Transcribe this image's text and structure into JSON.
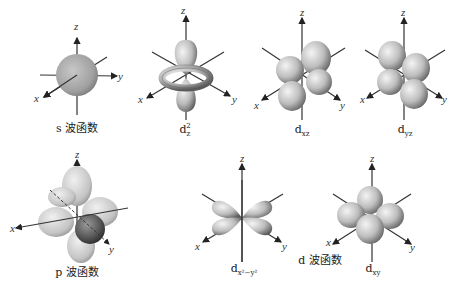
{
  "diagram": {
    "axis_labels": {
      "x": "x",
      "y": "y",
      "z": "z"
    },
    "orbitals": [
      {
        "id": "s",
        "caption": "s 波函数",
        "shape": "sphere"
      },
      {
        "id": "dz2",
        "caption_main": "d",
        "caption_sub": "z",
        "caption_sup": "2",
        "shape": "two-lobes-plus-torus"
      },
      {
        "id": "dxz",
        "caption_main": "d",
        "caption_sub": "xz",
        "shape": "four-lobes"
      },
      {
        "id": "dyz",
        "caption_main": "d",
        "caption_sub": "yz",
        "shape": "four-lobes"
      },
      {
        "id": "p",
        "caption": "p 波函数",
        "shape": "three-dumbbells"
      },
      {
        "id": "dx2-y2",
        "caption_main": "d",
        "caption_sub": "x²−y²",
        "shape": "four-lobes"
      },
      {
        "id": "dxy",
        "caption_main": "d",
        "caption_sub": "xy",
        "shape": "four-lobes"
      }
    ],
    "group_label_d": "d 波函数"
  },
  "colors": {
    "lobe_light": "#e6e6e6",
    "lobe_dark": "#6e6e6e",
    "axis": "#222222",
    "background": "#ffffff"
  }
}
